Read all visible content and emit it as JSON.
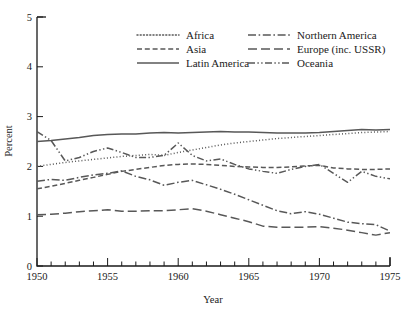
{
  "chart_data": {
    "type": "line",
    "title": "",
    "xlabel": "Year",
    "ylabel": "Percent",
    "xlim": [
      1950,
      1975
    ],
    "ylim": [
      0,
      5
    ],
    "xticks": [
      1950,
      1955,
      1960,
      1965,
      1970,
      1975
    ],
    "yticks": [
      0,
      1,
      2,
      3,
      4,
      5
    ],
    "xtick_labels": [
      "1950",
      "1955",
      "1960",
      "1965",
      "1970",
      "1975"
    ],
    "ytick_labels": [
      "0",
      "1",
      "2",
      "3",
      "4",
      "5"
    ],
    "minor_xtick_step": 1,
    "grid": false,
    "legend_position": "upper-center",
    "x": [
      1950,
      1951,
      1952,
      1953,
      1954,
      1955,
      1956,
      1957,
      1958,
      1959,
      1960,
      1961,
      1962,
      1963,
      1964,
      1965,
      1966,
      1967,
      1968,
      1969,
      1970,
      1971,
      1972,
      1973,
      1974,
      1975
    ],
    "series": [
      {
        "name": "Africa",
        "dash": "dotted",
        "values": [
          2.0,
          2.04,
          2.08,
          2.11,
          2.14,
          2.17,
          2.2,
          2.22,
          2.24,
          2.22,
          2.28,
          2.33,
          2.38,
          2.43,
          2.47,
          2.5,
          2.53,
          2.56,
          2.58,
          2.6,
          2.62,
          2.64,
          2.66,
          2.68,
          2.69,
          2.7
        ]
      },
      {
        "name": "Asia",
        "dash": "dashed",
        "values": [
          1.55,
          1.6,
          1.66,
          1.72,
          1.78,
          1.84,
          1.9,
          1.94,
          1.98,
          2.02,
          2.04,
          2.05,
          2.04,
          2.02,
          2.0,
          1.99,
          1.98,
          1.98,
          1.99,
          2.01,
          2.02,
          1.97,
          1.95,
          1.94,
          1.94,
          1.95
        ]
      },
      {
        "name": "Latin America",
        "dash": "solid",
        "values": [
          2.5,
          2.52,
          2.55,
          2.58,
          2.62,
          2.64,
          2.65,
          2.65,
          2.67,
          2.68,
          2.67,
          2.68,
          2.69,
          2.7,
          2.69,
          2.69,
          2.68,
          2.67,
          2.67,
          2.67,
          2.68,
          2.7,
          2.72,
          2.74,
          2.73,
          2.74
        ]
      },
      {
        "name": "Northern America",
        "dash": "dashdot",
        "values": [
          1.7,
          1.74,
          1.72,
          1.78,
          1.83,
          1.86,
          1.91,
          1.8,
          1.73,
          1.62,
          1.68,
          1.72,
          1.63,
          1.54,
          1.44,
          1.33,
          1.22,
          1.11,
          1.05,
          1.09,
          1.04,
          0.96,
          0.88,
          0.85,
          0.83,
          0.7
        ]
      },
      {
        "name": "Europe (inc. USSR)",
        "dash": "longdash",
        "values": [
          1.03,
          1.04,
          1.06,
          1.09,
          1.11,
          1.13,
          1.1,
          1.1,
          1.11,
          1.11,
          1.13,
          1.15,
          1.1,
          1.03,
          0.96,
          0.89,
          0.8,
          0.78,
          0.78,
          0.78,
          0.79,
          0.76,
          0.72,
          0.67,
          0.62,
          0.67
        ]
      },
      {
        "name": "Oceania",
        "dash": "dashdotdot",
        "values": [
          2.7,
          2.52,
          2.11,
          2.18,
          2.3,
          2.37,
          2.28,
          2.18,
          2.18,
          2.22,
          2.47,
          2.22,
          2.11,
          2.15,
          2.04,
          1.95,
          1.9,
          1.86,
          1.94,
          2.0,
          2.04,
          1.86,
          1.68,
          1.9,
          1.8,
          1.75
        ]
      }
    ]
  },
  "legend": {
    "entries": [
      {
        "label": "Africa"
      },
      {
        "label": "Asia"
      },
      {
        "label": "Latin America"
      },
      {
        "label": "Northern America"
      },
      {
        "label": "Europe (inc. USSR)"
      },
      {
        "label": "Oceania"
      }
    ]
  },
  "colors": {
    "line": "#585858",
    "axis": "#1a1a1a",
    "background": "#ffffff"
  }
}
